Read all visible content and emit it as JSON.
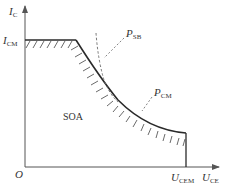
{
  "diagram": {
    "type": "transistor-safe-operating-area",
    "axes": {
      "y_label": {
        "main": "I",
        "sub": "C"
      },
      "x_label": {
        "main": "U",
        "sub": "CE"
      },
      "origin_label": "O"
    },
    "markers": {
      "icm": {
        "main": "I",
        "sub": "CM"
      },
      "ucem": {
        "main": "U",
        "sub": "CEM"
      }
    },
    "curves": {
      "psb": {
        "main": "P",
        "sub": "SB"
      },
      "pcm": {
        "main": "P",
        "sub": "CM"
      }
    },
    "region_label": "SOA",
    "colors": {
      "line": "#2a2a2a",
      "axis": "#555555",
      "text": "#333333"
    }
  }
}
